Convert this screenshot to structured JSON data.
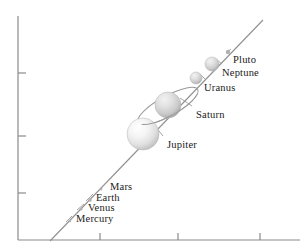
{
  "figure": {
    "type": "scatter-diagram",
    "background_color": "#ffffff",
    "axis_color": "#808080",
    "trend_line_color": "#8c8c8c",
    "label_color": "#1a1a1a"
  },
  "axes": {
    "y_axis": {
      "x": 18,
      "y_top": 16,
      "y_bottom": 240,
      "ticks_y": [
        73,
        136,
        193
      ],
      "tick_length": 8
    },
    "x_axis": {
      "y": 240,
      "x_left": 18,
      "x_right": 300,
      "ticks_x": [
        100,
        178,
        260
      ],
      "tick_length": 7
    },
    "tick_labels_x": [],
    "tick_labels_y": []
  },
  "trend_line": {
    "x1": 50,
    "y1": 241,
    "x2": 263,
    "y2": 20,
    "dashed": false
  },
  "chart_data": {
    "type": "scatter",
    "title": "",
    "xlabel": "",
    "ylabel": "",
    "grid": false,
    "legend": "none",
    "categories": [
      "Mercury",
      "Venus",
      "Earth",
      "Mars",
      "Jupiter",
      "Saturn",
      "Uranus",
      "Neptune",
      "Pluto"
    ],
    "points": [
      {
        "name": "Mercury",
        "cx": 70,
        "cy": 221,
        "r": 1.2,
        "label_x": 76,
        "label_y": 214,
        "tick_x1": 66,
        "tick_y1": 222,
        "tick_x2": 72,
        "tick_y2": 216
      },
      {
        "name": "Venus",
        "cx": 81,
        "cy": 209,
        "r": 1.6,
        "label_x": 88,
        "label_y": 203,
        "tick_x1": 77,
        "tick_y1": 210,
        "tick_x2": 84,
        "tick_y2": 204
      },
      {
        "name": "Earth",
        "cx": 90,
        "cy": 200,
        "r": 1.8,
        "label_x": 96,
        "label_y": 193,
        "tick_x1": 86,
        "tick_y1": 201,
        "tick_x2": 93,
        "tick_y2": 194
      },
      {
        "name": "Mars",
        "cx": 101,
        "cy": 189,
        "r": 1.4,
        "label_x": 110,
        "label_y": 182,
        "tick_x1": 99,
        "tick_y1": 190,
        "tick_x2": 107,
        "tick_y2": 182
      },
      {
        "name": "Jupiter",
        "cx": 143,
        "cy": 134,
        "r": 16.0,
        "label_x": 167,
        "label_y": 140,
        "tick_x1": 155,
        "tick_y1": 126,
        "tick_x2": 163,
        "tick_y2": 136
      },
      {
        "name": "Saturn",
        "cx": 168,
        "cy": 105,
        "r": 13.0,
        "label_x": 196,
        "label_y": 110,
        "tick_x1": 180,
        "tick_y1": 98,
        "tick_x2": 192,
        "tick_y2": 106
      },
      {
        "name": "Uranus",
        "cx": 196,
        "cy": 78,
        "r": 6.0,
        "label_x": 204,
        "label_y": 83,
        "tick_x1": 200,
        "tick_y1": 74,
        "tick_x2": 205,
        "tick_y2": 79
      },
      {
        "name": "Neptune",
        "cx": 212,
        "cy": 64,
        "r": 7.0,
        "label_x": 222,
        "label_y": 68,
        "tick_x1": 217,
        "tick_y1": 60,
        "tick_x2": 222,
        "tick_y2": 64
      },
      {
        "name": "Pluto",
        "cx": 228,
        "cy": 52,
        "r": 2.2,
        "label_x": 233,
        "label_y": 55,
        "tick_x1": 226,
        "tick_y1": 53,
        "tick_x2": 231,
        "tick_y2": 49
      }
    ],
    "saturn_ring": {
      "cx": 168,
      "cy": 106,
      "rx": 34,
      "ry": 10,
      "rotation": -29,
      "stroke": "#9a9a9a"
    },
    "sphere_colors": {
      "highlight": "#ffffff",
      "mid": "#ebebeb",
      "shadow": "#b4b4b4",
      "edge": "#a8a8a8"
    }
  },
  "labels": {
    "mercury": "Mercury",
    "venus": "Venus",
    "earth": "Earth",
    "mars": "Mars",
    "jupiter": "Jupiter",
    "saturn": "Saturn",
    "uranus": "Uranus",
    "neptune": "Neptune",
    "pluto": "Pluto"
  }
}
